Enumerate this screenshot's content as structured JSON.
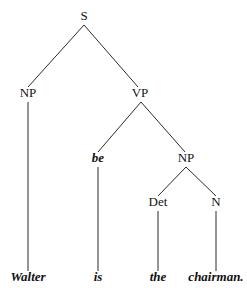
{
  "figure": {
    "kind": "constituency-syntax-tree",
    "sentence": "Walter is the chairman.",
    "background_color": "#ffffff",
    "line_color": "#2b2b2b",
    "text_color": "#141414"
  },
  "nodes": [
    {
      "id": "s",
      "label": "S",
      "x": 84,
      "y": 20,
      "style": "plain"
    },
    {
      "id": "np1",
      "label": "NP",
      "x": 28,
      "y": 97,
      "style": "plain"
    },
    {
      "id": "vp",
      "label": "VP",
      "x": 140,
      "y": 97,
      "style": "plain"
    },
    {
      "id": "be",
      "label": "be",
      "x": 98,
      "y": 162,
      "style": "italic-bold"
    },
    {
      "id": "np2",
      "label": "NP",
      "x": 186,
      "y": 162,
      "style": "plain"
    },
    {
      "id": "det",
      "label": "Det",
      "x": 158,
      "y": 206,
      "style": "plain"
    },
    {
      "id": "n",
      "label": "N",
      "x": 216,
      "y": 206,
      "style": "plain"
    }
  ],
  "terminals": [
    {
      "id": "t-walter",
      "label": "Walter",
      "x": 28,
      "y": 281
    },
    {
      "id": "t-is",
      "label": "is",
      "x": 98,
      "y": 281
    },
    {
      "id": "t-the",
      "label": "the",
      "x": 158,
      "y": 281
    },
    {
      "id": "t-chairman",
      "label": "chairman.",
      "x": 216,
      "y": 281
    }
  ],
  "edges": [
    {
      "id": "e-s-np1",
      "from": "s",
      "to": "np1",
      "x1": 84,
      "y1": 25,
      "x2": 28,
      "y2": 87
    },
    {
      "id": "e-s-vp",
      "from": "s",
      "to": "vp",
      "x1": 84,
      "y1": 25,
      "x2": 138,
      "y2": 87
    },
    {
      "id": "e-np1-w",
      "from": "np1",
      "to": "t-walter",
      "x1": 28,
      "y1": 102,
      "x2": 28,
      "y2": 271
    },
    {
      "id": "e-vp-be",
      "from": "vp",
      "to": "be",
      "x1": 141,
      "y1": 102,
      "x2": 98,
      "y2": 152
    },
    {
      "id": "e-vp-np2",
      "from": "vp",
      "to": "np2",
      "x1": 141,
      "y1": 102,
      "x2": 185,
      "y2": 152
    },
    {
      "id": "e-be-is",
      "from": "be",
      "to": "t-is",
      "x1": 98,
      "y1": 167,
      "x2": 98,
      "y2": 271
    },
    {
      "id": "e-np2-det",
      "from": "np2",
      "to": "det",
      "x1": 186,
      "y1": 167,
      "x2": 158,
      "y2": 196
    },
    {
      "id": "e-np2-n",
      "from": "np2",
      "to": "n",
      "x1": 186,
      "y1": 167,
      "x2": 216,
      "y2": 196
    },
    {
      "id": "e-det-the",
      "from": "det",
      "to": "t-the",
      "x1": 158,
      "y1": 211,
      "x2": 158,
      "y2": 271
    },
    {
      "id": "e-n-ch",
      "from": "n",
      "to": "t-chairman",
      "x1": 216,
      "y1": 211,
      "x2": 216,
      "y2": 271
    }
  ]
}
